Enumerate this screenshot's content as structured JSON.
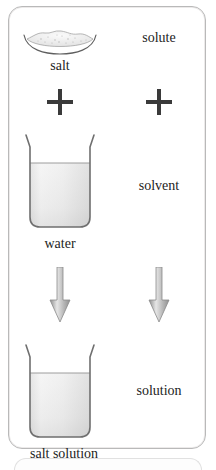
{
  "diagram": {
    "type": "solution-formation",
    "caption_column_left": "substances",
    "caption_column_right": "roles",
    "panel": {
      "border_color": "#b9b9b9",
      "background_color": "#ffffff"
    },
    "rows": [
      {
        "id": "solute-row",
        "left_label": "salt",
        "left_icon": "salt-dish-icon",
        "right_label": "solute"
      },
      {
        "id": "operator-row-1",
        "left_label": "+",
        "right_label": "+"
      },
      {
        "id": "solvent-row",
        "left_label": "water",
        "left_icon": "beaker-icon",
        "right_label": "solvent"
      },
      {
        "id": "arrow-row",
        "left_label": "down-arrow",
        "right_label": "down-arrow"
      },
      {
        "id": "solution-row",
        "left_label": "salt solution",
        "left_icon": "beaker-icon",
        "right_label": "solution"
      }
    ],
    "colors": {
      "outline": "#6f6f6f",
      "arrow_fill": "#a8a8a8",
      "liquid_top": "#f2f2f2",
      "liquid_bottom": "#d2d2d2",
      "text": "#1d1d1d",
      "plus": "#3a3a3a"
    }
  }
}
